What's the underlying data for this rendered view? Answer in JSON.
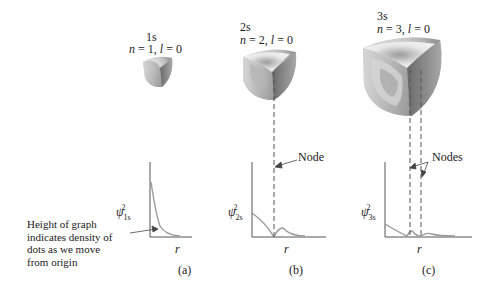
{
  "figure": {
    "panels": [
      {
        "id": "a",
        "orbital": "1s",
        "quantum_numbers": "n = 1, l = 0",
        "n_label": "n",
        "n_value": "1",
        "l_label": "l",
        "l_value": "0",
        "y_axis_label": "ψ",
        "y_sub": "1s",
        "y_sup": "2",
        "x_axis_label": "r",
        "caption": "(a)"
      },
      {
        "id": "b",
        "orbital": "2s",
        "n_value": "2",
        "l_value": "0",
        "y_axis_label": "ψ",
        "y_sub": "2s",
        "y_sup": "2",
        "x_axis_label": "r",
        "caption": "(b)",
        "annotation": "Node"
      },
      {
        "id": "c",
        "orbital": "3s",
        "n_value": "3",
        "l_value": "0",
        "y_axis_label": "ψ",
        "y_sub": "3s",
        "y_sup": "2",
        "x_axis_label": "r",
        "caption": "(c)",
        "annotation": "Nodes"
      }
    ],
    "side_note": {
      "lines": [
        "Height of graph",
        "indicates density of",
        "dots as we move",
        "from origin"
      ]
    },
    "colors": {
      "axis": "#555555",
      "curve": "#9a9a9a",
      "text": "#222222",
      "dash": "#555555"
    }
  }
}
